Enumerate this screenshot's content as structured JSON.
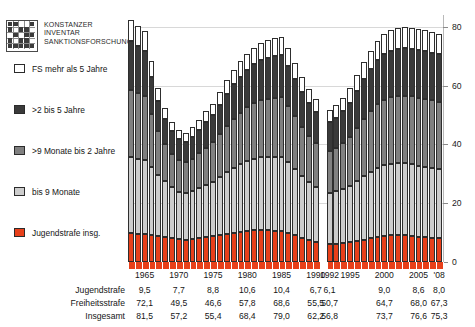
{
  "logo": {
    "line1": "KONSTANZER",
    "line2": "INVENTAR",
    "line3": "SANKTIONSFORSCHUNG",
    "icon": "logo-grid-mark"
  },
  "legend": {
    "items": [
      {
        "label": "FS mehr als 5 Jahre",
        "color": "#ffffff"
      },
      {
        "label": ">2 bis 5 Jahre",
        "color": "#3a3a3a"
      },
      {
        "label": ">9 Monate bis 2 Jahre",
        "color": "#808080"
      },
      {
        "label": "bis 9 Monate",
        "color": "#cdcdcd"
      },
      {
        "label": "Jugendstrafe insg.",
        "color": "#e8401a"
      }
    ]
  },
  "axis": {
    "y_ticks": [
      0,
      20,
      40,
      60,
      80
    ],
    "y_min": 0,
    "y_max": 84,
    "x_tick_labels": [
      "1965",
      "1970",
      "1975",
      "1980",
      "1985",
      "1990",
      "1992",
      "1995",
      "2000",
      "2005",
      "'08"
    ]
  },
  "table": {
    "columns": [
      "1965",
      "1970",
      "1975",
      "1980",
      "1985",
      "1990",
      "1992",
      "1995",
      "2000",
      "2005",
      "'08"
    ],
    "rows": [
      {
        "label": "Jugendstrafe",
        "values": [
          "9,5",
          "7,7",
          "8,8",
          "10,6",
          "10,4",
          "6,7",
          "6,1",
          "",
          "9,0",
          "8,6",
          "8,0"
        ]
      },
      {
        "label": "Freiheitsstrafe",
        "values": [
          "72,1",
          "49,5",
          "46,6",
          "57,8",
          "68,6",
          "55,5",
          "50,7",
          "",
          "64,7",
          "68,0",
          "67,3"
        ]
      },
      {
        "label": "Insgesamt",
        "values": [
          "81,5",
          "57,2",
          "55,4",
          "68,4",
          "79,0",
          "62,2",
          "56,8",
          "",
          "73,7",
          "76,6",
          "75,3"
        ]
      }
    ]
  },
  "chart_data": {
    "type": "bar",
    "stacked": true,
    "title": "",
    "xlabel": "",
    "ylabel": "",
    "ylim": [
      0,
      84
    ],
    "grid": true,
    "legend_position": "left",
    "gap_after_category": "1990",
    "series": [
      {
        "name": "Jugendstrafe insg.",
        "color": "#e8401a"
      },
      {
        "name": "bis 9 Monate",
        "color": "#cdcdcd"
      },
      {
        "name": ">9 Monate bis 2 Jahre",
        "color": "#808080"
      },
      {
        "name": ">2 bis 5 Jahre",
        "color": "#3a3a3a"
      },
      {
        "name": "FS mehr als 5 Jahre",
        "color": "#ffffff"
      }
    ],
    "categories": [
      "1963",
      "1964",
      "1965",
      "1966",
      "1967",
      "1968",
      "1969",
      "1970",
      "1971",
      "1972",
      "1973",
      "1974",
      "1975",
      "1976",
      "1977",
      "1978",
      "1979",
      "1980",
      "1981",
      "1982",
      "1983",
      "1984",
      "1985",
      "1986",
      "1987",
      "1988",
      "1989",
      "1990",
      "1992",
      "1993",
      "1994",
      "1995",
      "1996",
      "1997",
      "1998",
      "1999",
      "2000",
      "2001",
      "2002",
      "2003",
      "2004",
      "2005",
      "2006",
      "2007",
      "2008"
    ],
    "values": {
      "Jugendstrafe insg.": [
        9.8,
        9.6,
        9.5,
        9.3,
        8.9,
        8.4,
        8.0,
        7.7,
        7.6,
        7.9,
        8.2,
        8.5,
        8.8,
        9.2,
        9.6,
        10.0,
        10.3,
        10.6,
        10.8,
        10.9,
        10.8,
        10.6,
        10.4,
        9.9,
        9.1,
        8.2,
        7.4,
        6.7,
        6.1,
        6.2,
        6.4,
        6.7,
        7.1,
        7.6,
        8.1,
        8.6,
        9.0,
        9.2,
        9.3,
        9.3,
        9.0,
        8.6,
        8.4,
        8.2,
        8.0
      ],
      "bis 9 Monate": [
        26.0,
        25.6,
        25.2,
        23.0,
        20.8,
        19.0,
        17.4,
        16.2,
        15.8,
        16.3,
        17.0,
        17.8,
        18.5,
        19.7,
        20.9,
        22.0,
        22.9,
        23.7,
        24.3,
        24.8,
        25.0,
        25.2,
        25.3,
        24.0,
        22.4,
        21.0,
        19.8,
        18.8,
        17.5,
        17.8,
        18.4,
        19.2,
        20.4,
        21.6,
        22.6,
        23.4,
        24.0,
        24.2,
        24.3,
        24.3,
        24.2,
        24.0,
        23.9,
        23.8,
        23.6
      ],
      ">9 Monate bis 2 Jahre": [
        22.8,
        22.2,
        21.6,
        18.0,
        15.0,
        12.8,
        11.4,
        10.8,
        10.5,
        11.0,
        11.8,
        12.6,
        13.4,
        14.6,
        15.8,
        16.8,
        17.6,
        18.3,
        18.9,
        19.4,
        19.8,
        20.1,
        20.4,
        19.3,
        18.0,
        16.8,
        15.8,
        15.0,
        14.2,
        14.8,
        15.6,
        16.6,
        18.0,
        19.4,
        20.6,
        21.6,
        22.2,
        22.6,
        22.8,
        23.0,
        23.1,
        23.2,
        23.1,
        23.0,
        22.9
      ],
      ">2 bis 5 Jahre": [
        16.4,
        16.0,
        15.6,
        12.5,
        10.2,
        8.6,
        7.6,
        7.2,
        7.0,
        7.4,
        8.0,
        8.6,
        9.2,
        10.0,
        10.9,
        11.6,
        12.2,
        12.7,
        13.2,
        13.6,
        13.9,
        14.1,
        14.3,
        13.6,
        12.6,
        11.8,
        11.1,
        10.5,
        9.8,
        10.2,
        10.8,
        11.6,
        12.6,
        13.6,
        14.4,
        15.1,
        15.6,
        15.9,
        16.1,
        16.2,
        16.3,
        16.4,
        16.3,
        16.2,
        16.1
      ],
      "FS mehr als 5 Jahre": [
        7.2,
        7.0,
        6.8,
        5.4,
        4.4,
        3.7,
        3.3,
        3.1,
        3.0,
        3.2,
        3.4,
        3.7,
        4.0,
        4.3,
        4.7,
        5.0,
        5.3,
        5.5,
        5.7,
        5.9,
        6.0,
        6.1,
        6.2,
        5.9,
        5.5,
        5.1,
        4.8,
        4.6,
        4.2,
        4.4,
        4.7,
        5.0,
        5.4,
        5.9,
        6.2,
        6.5,
        6.7,
        6.9,
        7.0,
        7.0,
        7.1,
        7.1,
        7.1,
        7.0,
        7.0
      ]
    }
  }
}
